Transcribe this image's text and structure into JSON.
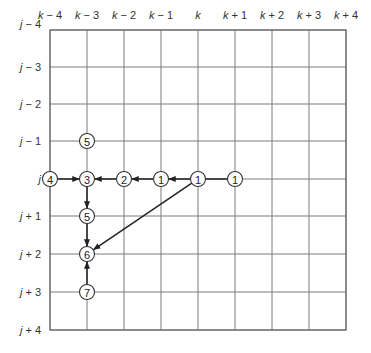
{
  "diagram": {
    "type": "grid-path-diagram",
    "columns": [
      "k − 4",
      "k − 3",
      "k − 2",
      "k − 1",
      "k",
      "k + 1",
      "k + 2",
      "k + 3",
      "k + 4"
    ],
    "rows": [
      "j − 4",
      "j − 3",
      "j − 2",
      "j − 1",
      "j",
      "j + 1",
      "j + 2",
      "j + 3",
      "j + 4"
    ],
    "nodes": [
      {
        "id": "n5a",
        "label": "5",
        "col": 1,
        "row": 3
      },
      {
        "id": "n4",
        "label": "4",
        "col": 0,
        "row": 4
      },
      {
        "id": "n3",
        "label": "3",
        "col": 1,
        "row": 4
      },
      {
        "id": "n2",
        "label": "2",
        "col": 2,
        "row": 4
      },
      {
        "id": "n1a",
        "label": "1",
        "col": 3,
        "row": 4
      },
      {
        "id": "n1b",
        "label": "1",
        "col": 4,
        "row": 4
      },
      {
        "id": "n1c",
        "label": "1",
        "col": 5,
        "row": 4
      },
      {
        "id": "n5b",
        "label": "5",
        "col": 1,
        "row": 5
      },
      {
        "id": "n6",
        "label": "6",
        "col": 1,
        "row": 6
      },
      {
        "id": "n7",
        "label": "7",
        "col": 1,
        "row": 7
      }
    ],
    "edges": [
      {
        "from": "n4",
        "to": "n3",
        "arrow": true
      },
      {
        "from": "n2",
        "to": "n3",
        "arrow": true
      },
      {
        "from": "n1a",
        "to": "n2",
        "arrow": true
      },
      {
        "from": "n1b",
        "to": "n1a",
        "arrow": true
      },
      {
        "from": "n1b",
        "to": "n1c",
        "arrow": false
      },
      {
        "from": "n3",
        "to": "n5b",
        "arrow": true
      },
      {
        "from": "n5b",
        "to": "n6",
        "arrow": true
      },
      {
        "from": "n7",
        "to": "n6",
        "arrow": true
      },
      {
        "from": "n1b",
        "to": "n6",
        "arrow": true
      }
    ]
  }
}
